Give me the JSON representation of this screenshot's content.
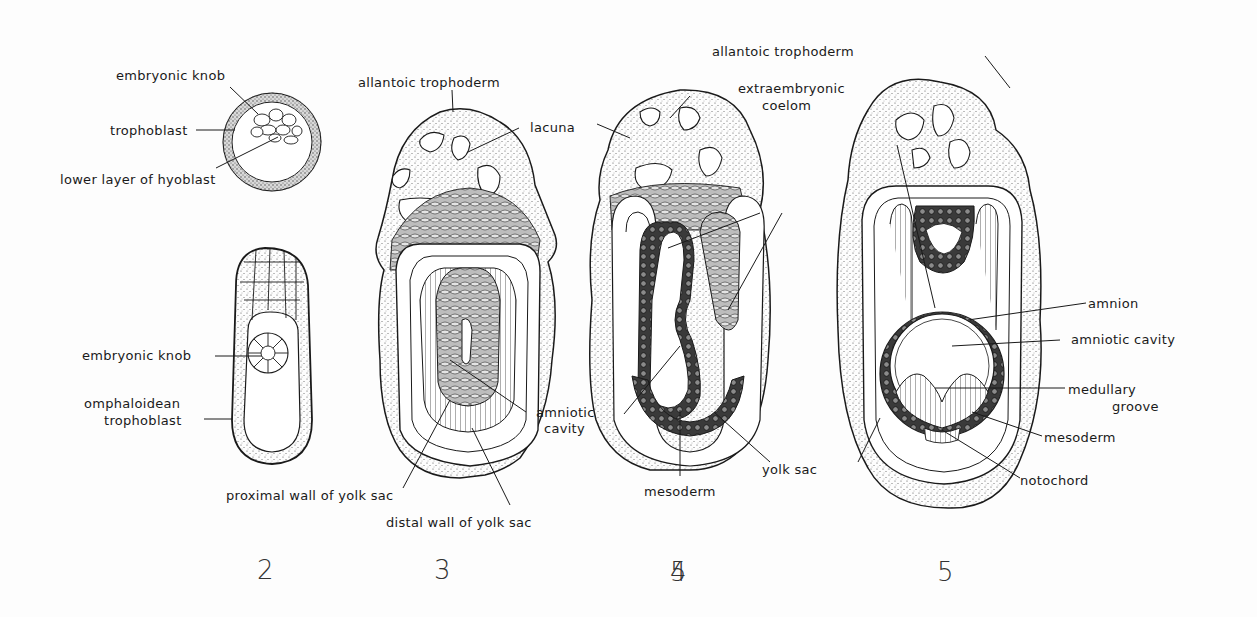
{
  "figure": {
    "style": {
      "ink": "#1a1a1a",
      "paper": "#fdfdfd",
      "stipple": "#555555",
      "dark_tissue": "#2a2a2a"
    },
    "panels": [
      {
        "number": "2",
        "labels": {
          "embryonic_knob_top": "embryonic knob",
          "trophoblast": "trophoblast",
          "lower_layer": "lower layer of hyoblast",
          "embryonic_knob_bottom": "embryonic knob",
          "omphaloidean_1": "omphaloidean",
          "omphaloidean_2": "trophoblast"
        }
      },
      {
        "number": "3",
        "labels": {
          "allantoic_trophoderm": "allantoic trophoderm",
          "lacuna": "lacuna",
          "amniotic_1": "amniotic",
          "amniotic_2": "cavity",
          "proximal_wall": "proximal wall of yolk sac",
          "distal_wall": "distal wall of yolk sac"
        }
      },
      {
        "number": "4",
        "labels": {
          "allantoic_trophoderm": "allantoic trophoderm",
          "extraembryonic_1": "extraembryonic",
          "extraembryonic_2": "coelom",
          "mesoderm": "mesoderm",
          "yolk_sac": "yolk sac"
        }
      },
      {
        "number": "5",
        "labels": {
          "amnion": "amnion",
          "amniotic_cavity": "amniotic cavity",
          "medullary_1": "medullary",
          "medullary_2": "groove",
          "mesoderm": "mesoderm",
          "notochord": "notochord"
        }
      }
    ]
  }
}
